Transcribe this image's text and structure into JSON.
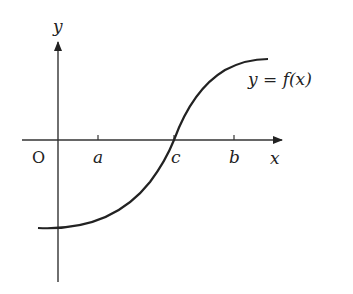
{
  "diagram": {
    "axes": {
      "x_label": "x",
      "y_label": "y",
      "origin_label": "O"
    },
    "ticks": [
      {
        "label": "a"
      },
      {
        "label": "c"
      },
      {
        "label": "b"
      }
    ],
    "curve_label": "y = f(x)",
    "colors": {
      "stroke": "#222222",
      "background": "#ffffff"
    }
  }
}
